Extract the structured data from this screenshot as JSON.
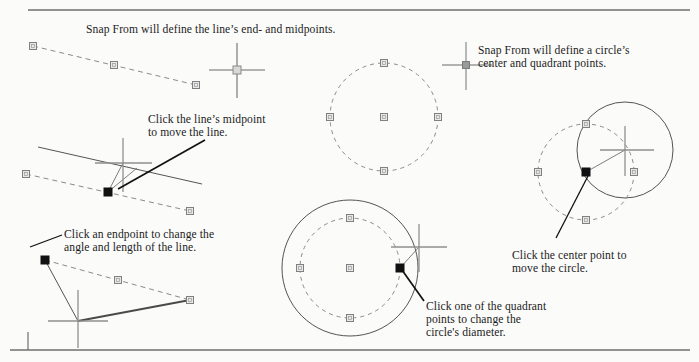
{
  "page": {
    "width": 699,
    "height": 362,
    "background": "#fbfbfa",
    "rule_color": "#6f6f6f"
  },
  "captions": {
    "heading": "Snap From will define the line’s end- and midpoints.",
    "circle_definition": "Snap From will define a circle’s\ncenter and quadrant points.",
    "midpoint": "Click the line’s midpoint\nto move the line.",
    "endpoint": "Click an endpoint to change the\nangle and length of the line.",
    "center": "Click the center point to\nmove the circle.",
    "quadrant": "Click one of the quadrant\npoints to change the\ncircle's diameter."
  },
  "colors": {
    "text": "#1c1c1c",
    "grip_unselected_stroke": "#808080",
    "grip_unselected_fill": "#e8e8e8",
    "grip_selected_fill": "#111111",
    "dashed_geometry": "#8a8a8a",
    "solid_geometry": "#4a4a4a",
    "crosshair": "#909090",
    "leader": "#111111",
    "rubber_band": "#606060"
  },
  "figures": [
    {
      "id": "line-unselected",
      "type": "line",
      "state": "grips-shown",
      "label": "dashed line with end and midpoint grips",
      "endpoints": [
        [
          33,
          46
        ],
        [
          196,
          85
        ]
      ],
      "midpoint": [
        114,
        65
      ],
      "grips": [
        {
          "name": "grip-line-start",
          "x": 33,
          "y": 46,
          "selected": false
        },
        {
          "name": "grip-line-midpoint",
          "x": 114,
          "y": 65,
          "selected": false
        },
        {
          "name": "grip-line-end",
          "x": 196,
          "y": 85,
          "selected": false
        }
      ],
      "crosshair": {
        "x": 237,
        "y": 70,
        "snap_marker": true
      }
    },
    {
      "id": "circle-unselected",
      "type": "circle",
      "state": "grips-shown",
      "label": "dashed circle with center and quadrant grips",
      "center": [
        384,
        117
      ],
      "radius": 54,
      "grips": [
        {
          "name": "grip-circle-center",
          "x": 384,
          "y": 117,
          "selected": false
        },
        {
          "name": "grip-circle-north",
          "x": 384,
          "y": 63,
          "selected": false
        },
        {
          "name": "grip-circle-east",
          "x": 438,
          "y": 117,
          "selected": false
        },
        {
          "name": "grip-circle-south",
          "x": 384,
          "y": 171,
          "selected": false
        },
        {
          "name": "grip-circle-west",
          "x": 330,
          "y": 117,
          "selected": false
        }
      ],
      "crosshair": {
        "x": 466,
        "y": 65,
        "snap_marker": true
      }
    },
    {
      "id": "line-move-midpoint",
      "type": "line",
      "state": "midpoint-grip-selected-moving",
      "label": "line being moved by its midpoint grip",
      "endpoints": [
        [
          26,
          174
        ],
        [
          190,
          211
        ]
      ],
      "midpoint": [
        108,
        192
      ],
      "grips": [
        {
          "name": "grip-move-start",
          "x": 26,
          "y": 174,
          "selected": false
        },
        {
          "name": "grip-move-midpoint",
          "x": 108,
          "y": 192,
          "selected": true
        },
        {
          "name": "grip-move-end",
          "x": 190,
          "y": 211,
          "selected": false
        }
      ],
      "ghost_line": [
        [
          38,
          147
        ],
        [
          202,
          184
        ]
      ],
      "crosshair": {
        "x": 123,
        "y": 163
      }
    },
    {
      "id": "line-stretch-endpoint",
      "type": "line",
      "state": "endpoint-grip-selected-stretching",
      "label": "line endpoint being stretched to new angle and length",
      "endpoints": [
        [
          45,
          260
        ],
        [
          190,
          300
        ]
      ],
      "midpoint": [
        118,
        280
      ],
      "grips": [
        {
          "name": "grip-stretch-start",
          "x": 45,
          "y": 260,
          "selected": true
        },
        {
          "name": "grip-stretch-midpoint",
          "x": 118,
          "y": 280,
          "selected": false
        },
        {
          "name": "grip-stretch-end",
          "x": 190,
          "y": 300,
          "selected": false
        }
      ],
      "ghost_line": [
        [
          45,
          260
        ],
        [
          78,
          321
        ]
      ],
      "rubber_band": [
        [
          78,
          321
        ],
        [
          190,
          300
        ]
      ],
      "crosshair": {
        "x": 78,
        "y": 321
      }
    },
    {
      "id": "circle-resize-quadrant",
      "type": "circle",
      "state": "quadrant-grip-selected-resizing",
      "label": "circle diameter being changed from a quadrant grip",
      "center": [
        350,
        268
      ],
      "radius": 50,
      "new_radius": 68,
      "grips": [
        {
          "name": "grip-resize-center",
          "x": 350,
          "y": 268,
          "selected": false
        },
        {
          "name": "grip-resize-north",
          "x": 350,
          "y": 218,
          "selected": false
        },
        {
          "name": "grip-resize-east",
          "x": 400,
          "y": 268,
          "selected": true
        },
        {
          "name": "grip-resize-south",
          "x": 350,
          "y": 318,
          "selected": false
        },
        {
          "name": "grip-resize-west",
          "x": 300,
          "y": 268,
          "selected": false
        }
      ],
      "crosshair": {
        "x": 419,
        "y": 247
      }
    },
    {
      "id": "circle-move-center",
      "type": "circle",
      "state": "center-grip-selected-moving",
      "label": "circle being moved by its center grip",
      "center": [
        586,
        172
      ],
      "radius": 48,
      "moved_center": [
        625,
        150
      ],
      "grips": [
        {
          "name": "grip-movecircle-center",
          "x": 586,
          "y": 172,
          "selected": true
        },
        {
          "name": "grip-movecircle-north",
          "x": 586,
          "y": 124,
          "selected": false
        },
        {
          "name": "grip-movecircle-east",
          "x": 634,
          "y": 172,
          "selected": false
        },
        {
          "name": "grip-movecircle-south",
          "x": 586,
          "y": 220,
          "selected": false
        },
        {
          "name": "grip-movecircle-west",
          "x": 538,
          "y": 172,
          "selected": false
        }
      ],
      "crosshair": {
        "x": 625,
        "y": 150
      }
    }
  ],
  "leaders": [
    {
      "name": "leader-midpoint",
      "from": [
        205,
        140
      ],
      "to": [
        118,
        189
      ]
    },
    {
      "name": "leader-endpoint",
      "from": [
        62,
        235
      ],
      "to": [
        30,
        247
      ]
    },
    {
      "name": "leader-center",
      "from": [
        556,
        238
      ],
      "to": [
        588,
        176
      ]
    },
    {
      "name": "leader-quadrant",
      "from": [
        424,
        301
      ],
      "to": [
        402,
        270
      ]
    }
  ]
}
